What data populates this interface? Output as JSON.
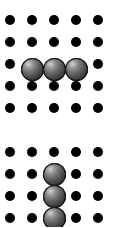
{
  "figure": {
    "background_color": "#ffffff",
    "width": 119,
    "height": 227
  },
  "colors": {
    "lattice_atom": "#000000",
    "sphere_highlight": "#d8d8d8",
    "sphere_midtone": "#6e6e6e",
    "sphere_shadow": "#141414",
    "sphere_outline": "#111111",
    "background": "#ffffff"
  },
  "geometry": {
    "lattice_spacing_x": 22,
    "lattice_spacing_y": 22,
    "lattice_dot_diameter": 10,
    "sphere_diameter": 23,
    "column_x": [
      10,
      32,
      54,
      76,
      98
    ],
    "panel_gap": 10
  },
  "panels": [
    {
      "id": "panel-top",
      "name": "horizontal-trimer-panel",
      "top": 0,
      "height": 122,
      "row_y": [
        20,
        42,
        64,
        86,
        108
      ],
      "columns": 5,
      "rows": 5,
      "lattice_atoms": [
        {
          "row": 0,
          "col": 0,
          "x": 10,
          "y": 20
        },
        {
          "row": 0,
          "col": 1,
          "x": 32,
          "y": 20
        },
        {
          "row": 0,
          "col": 2,
          "x": 54,
          "y": 20
        },
        {
          "row": 0,
          "col": 3,
          "x": 76,
          "y": 20
        },
        {
          "row": 0,
          "col": 4,
          "x": 98,
          "y": 20
        },
        {
          "row": 1,
          "col": 0,
          "x": 10,
          "y": 42
        },
        {
          "row": 1,
          "col": 1,
          "x": 32,
          "y": 42
        },
        {
          "row": 1,
          "col": 2,
          "x": 54,
          "y": 42
        },
        {
          "row": 1,
          "col": 3,
          "x": 76,
          "y": 42
        },
        {
          "row": 1,
          "col": 4,
          "x": 98,
          "y": 42
        },
        {
          "row": 2,
          "col": 0,
          "x": 10,
          "y": 64
        },
        {
          "row": 2,
          "col": 4,
          "x": 98,
          "y": 64
        },
        {
          "row": 3,
          "col": 0,
          "x": 10,
          "y": 86
        },
        {
          "row": 3,
          "col": 1,
          "x": 32,
          "y": 86
        },
        {
          "row": 3,
          "col": 2,
          "x": 54,
          "y": 86
        },
        {
          "row": 3,
          "col": 3,
          "x": 76,
          "y": 86
        },
        {
          "row": 3,
          "col": 4,
          "x": 98,
          "y": 86
        },
        {
          "row": 4,
          "col": 0,
          "x": 10,
          "y": 108
        },
        {
          "row": 4,
          "col": 1,
          "x": 32,
          "y": 108
        },
        {
          "row": 4,
          "col": 2,
          "x": 54,
          "y": 108
        },
        {
          "row": 4,
          "col": 3,
          "x": 76,
          "y": 108
        },
        {
          "row": 4,
          "col": 4,
          "x": 98,
          "y": 108
        }
      ],
      "spheres": [
        {
          "index": 0,
          "row": 2,
          "col": 1,
          "x": 32,
          "y": 69
        },
        {
          "index": 1,
          "row": 2,
          "col": 2,
          "x": 54,
          "y": 69
        },
        {
          "index": 2,
          "row": 2,
          "col": 3,
          "x": 76,
          "y": 69
        }
      ],
      "cluster_orientation": "horizontal",
      "cluster_size": 3
    },
    {
      "id": "panel-bottom",
      "name": "vertical-chain-panel",
      "top": 132,
      "height": 95,
      "row_y": [
        20,
        42,
        64,
        86
      ],
      "columns": 5,
      "rows": 4,
      "lattice_atoms": [
        {
          "row": 0,
          "col": 0,
          "x": 10,
          "y": 20
        },
        {
          "row": 0,
          "col": 1,
          "x": 32,
          "y": 20
        },
        {
          "row": 0,
          "col": 2,
          "x": 54,
          "y": 20
        },
        {
          "row": 0,
          "col": 3,
          "x": 76,
          "y": 20
        },
        {
          "row": 0,
          "col": 4,
          "x": 98,
          "y": 20
        },
        {
          "row": 1,
          "col": 0,
          "x": 10,
          "y": 42
        },
        {
          "row": 1,
          "col": 1,
          "x": 32,
          "y": 42
        },
        {
          "row": 1,
          "col": 3,
          "x": 76,
          "y": 42
        },
        {
          "row": 1,
          "col": 4,
          "x": 98,
          "y": 42
        },
        {
          "row": 2,
          "col": 0,
          "x": 10,
          "y": 64
        },
        {
          "row": 2,
          "col": 1,
          "x": 32,
          "y": 64
        },
        {
          "row": 2,
          "col": 3,
          "x": 76,
          "y": 64
        },
        {
          "row": 2,
          "col": 4,
          "x": 98,
          "y": 64
        },
        {
          "row": 3,
          "col": 0,
          "x": 10,
          "y": 86
        },
        {
          "row": 3,
          "col": 1,
          "x": 32,
          "y": 86
        },
        {
          "row": 3,
          "col": 3,
          "x": 76,
          "y": 86
        },
        {
          "row": 3,
          "col": 4,
          "x": 98,
          "y": 86
        }
      ],
      "spheres": [
        {
          "index": 0,
          "row": 1,
          "col": 2,
          "x": 54,
          "y": 42
        },
        {
          "index": 1,
          "row": 2,
          "col": 2,
          "x": 54,
          "y": 64
        },
        {
          "index": 2,
          "row": 3,
          "col": 2,
          "x": 54,
          "y": 86
        }
      ],
      "cluster_orientation": "vertical",
      "cluster_size": 3
    }
  ]
}
